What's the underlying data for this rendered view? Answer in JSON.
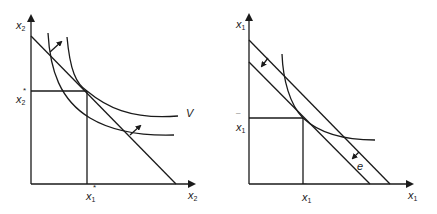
{
  "colors": {
    "ink": "#1a1a1a",
    "background": "#ffffff"
  },
  "left_diagram": {
    "y_axis_label": {
      "base": "x",
      "sub": "2"
    },
    "x_axis_label": {
      "base": "x",
      "sub": "2"
    },
    "y_tick_label": {
      "base": "x",
      "sub": "2",
      "mark": "*"
    },
    "x_tick_label": {
      "base": "x",
      "sub": "1",
      "mark": "*"
    },
    "curve_label": "V"
  },
  "right_diagram": {
    "y_axis_label": {
      "base": "x",
      "sub": "1"
    },
    "x_axis_label": {
      "base": "x",
      "sub": "1"
    },
    "y_tick_label": {
      "base": "x",
      "sub": "1",
      "mark": "¯"
    },
    "x_tick_label": {
      "base": "x",
      "sub": "1",
      "mark": "¯"
    },
    "shift_label": "e"
  }
}
